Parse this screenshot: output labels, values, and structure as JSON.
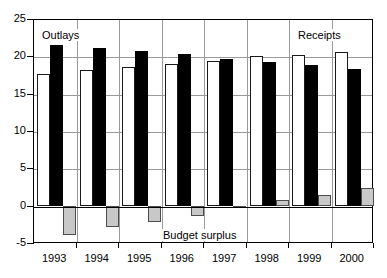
{
  "chart_data": {
    "type": "bar",
    "title": "",
    "subtitle": "",
    "xlabel": "",
    "ylabel": "",
    "categories": [
      "1993",
      "1994",
      "1995",
      "1996",
      "1997",
      "1998",
      "1999",
      "2000"
    ],
    "ylim": [
      -5,
      25
    ],
    "yticks": [
      -5,
      0,
      5,
      10,
      15,
      20,
      25
    ],
    "ytick_labels": [
      "-5",
      "0",
      "5",
      "10",
      "15",
      "20",
      "25"
    ],
    "grid": true,
    "grid_axis": "y",
    "legend_position": "inline-annotations",
    "series": [
      {
        "name": "Receipts",
        "style": "white-filled-black-outline",
        "color": "#ffffff",
        "edge_color": "#1a1a1a",
        "values": [
          17.6,
          18.2,
          18.6,
          19.0,
          19.4,
          20.0,
          20.2,
          20.6
        ]
      },
      {
        "name": "Outlays",
        "style": "black-filled",
        "color": "#000000",
        "edge_color": "#000000",
        "values": [
          21.5,
          21.1,
          20.7,
          20.3,
          19.7,
          19.2,
          18.8,
          18.3
        ]
      },
      {
        "name": "Budget surplus",
        "style": "gray-filled",
        "color": "#c8c8c8",
        "edge_color": "#4d4d4d",
        "values": [
          -3.9,
          -2.9,
          -2.2,
          -1.4,
          -0.3,
          0.8,
          1.4,
          2.4
        ]
      }
    ],
    "annotations": [
      {
        "id": "outlays",
        "text": "Outlays",
        "series": "Outlays"
      },
      {
        "id": "receipts",
        "text": "Receipts",
        "series": "Receipts"
      },
      {
        "id": "surplus",
        "text": "Budget surplus",
        "series": "Budget surplus"
      }
    ]
  }
}
